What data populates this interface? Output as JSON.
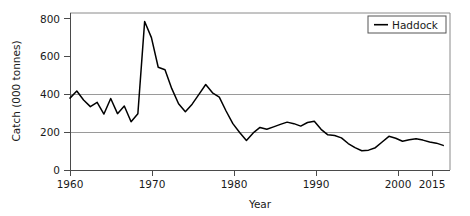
{
  "chart_data": {
    "type": "line",
    "title": "",
    "xlabel": "Year",
    "ylabel": "Catch (000 tonnes)",
    "xlim": [
      1960,
      2016
    ],
    "ylim": [
      0,
      830
    ],
    "grid": "horizontal gridlines at 200 and 400",
    "legend_position": "top-right",
    "x_ticks": [
      1960,
      1970,
      1980,
      1990,
      2000,
      2015
    ],
    "x_tick_labels": [
      "1960",
      "1970",
      "1980",
      "1990",
      "2000",
      "2015"
    ],
    "y_ticks": [
      0,
      200,
      400,
      600,
      800
    ],
    "y_tick_labels": [
      "0",
      "200",
      "400",
      "600",
      "800"
    ],
    "series": [
      {
        "name": "Haddock",
        "color": "#000000",
        "x": [
          1960,
          1961,
          1962,
          1963,
          1964,
          1965,
          1966,
          1967,
          1968,
          1969,
          1970,
          1971,
          1972,
          1973,
          1974,
          1975,
          1976,
          1977,
          1978,
          1979,
          1980,
          1981,
          1982,
          1983,
          1984,
          1985,
          1986,
          1987,
          1988,
          1989,
          1990,
          1991,
          1992,
          1993,
          1994,
          1995,
          1996,
          1997,
          1998,
          1999,
          2000,
          2001,
          2002,
          2003,
          2004,
          2005,
          2006,
          2007,
          2008,
          2009,
          2010,
          2011,
          2012,
          2013,
          2014,
          2015
        ],
        "values": [
          380,
          418,
          370,
          335,
          358,
          296,
          378,
          298,
          338,
          255,
          297,
          785,
          700,
          543,
          530,
          430,
          350,
          308,
          348,
          400,
          452,
          408,
          385,
          312,
          245,
          198,
          156,
          196,
          225,
          215,
          228,
          241,
          253,
          245,
          232,
          251,
          258,
          215,
          186,
          182,
          170,
          140,
          118,
          102,
          105,
          118,
          148,
          178,
          168,
          152,
          160,
          165,
          158,
          148,
          142,
          130
        ]
      }
    ],
    "annotations": []
  },
  "chart": {
    "y_axis": {
      "label": "Catch (000 tonnes)",
      "ticks": [
        "800",
        "600",
        "400",
        "200",
        "0"
      ]
    },
    "x_axis": {
      "label": "Year",
      "ticks": [
        "1960",
        "1970",
        "1980",
        "1990",
        "2000",
        "2015"
      ]
    },
    "legend": {
      "entries": [
        {
          "label": "Haddock",
          "color": "#000000"
        }
      ]
    },
    "colors": {
      "series": "#000000",
      "gridline": "#9a9a9a",
      "frame": "#8a8a8a",
      "background": "#ffffff"
    }
  }
}
